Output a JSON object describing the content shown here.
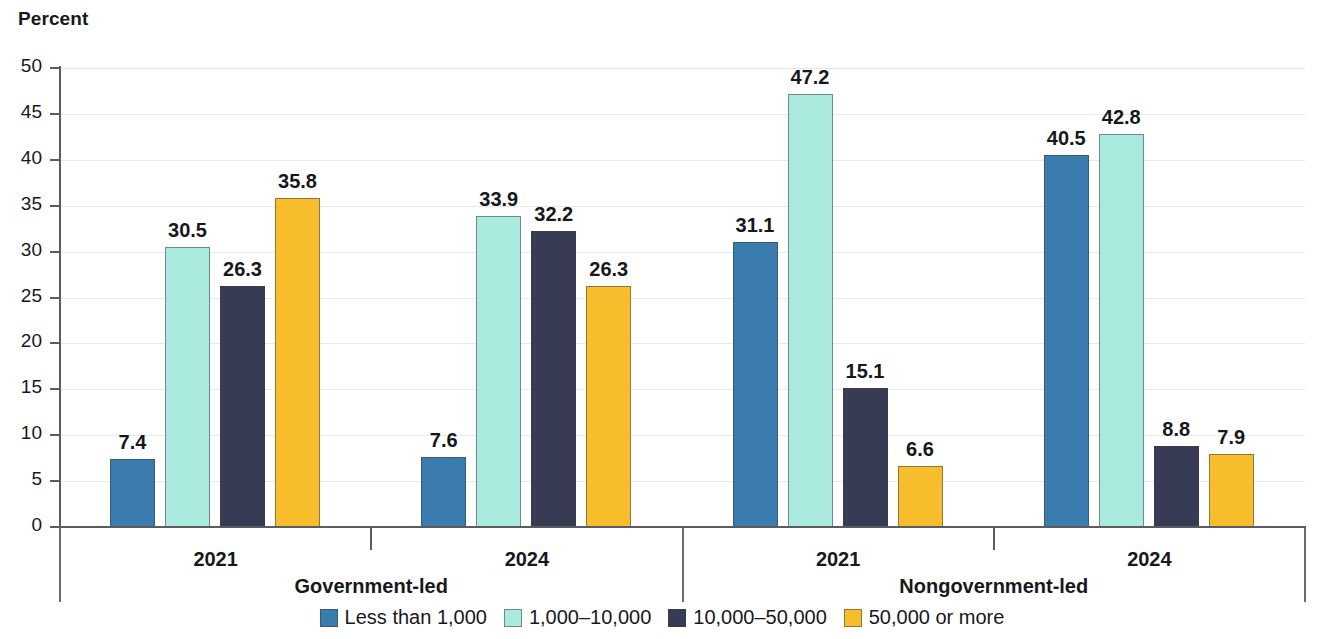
{
  "chart_data": {
    "type": "bar",
    "title": "",
    "ylabel": "Percent",
    "xlabel": "",
    "ylim": [
      0,
      50
    ],
    "ytick_step": 5,
    "yticks": [
      50,
      45,
      40,
      35,
      30,
      25,
      20,
      15,
      10,
      5,
      0
    ],
    "grid": true,
    "legend_position": "bottom",
    "categories": [
      "2021",
      "2024",
      "2021",
      "2024"
    ],
    "group_labels": [
      "Government-led",
      "Nongovernment-led"
    ],
    "groups": [
      {
        "super_label": "Government-led",
        "year": "2021",
        "values": [
          7.4,
          30.5,
          26.3,
          35.8
        ],
        "labels": [
          "7.4",
          "30.5",
          "26.3",
          "35.8"
        ]
      },
      {
        "super_label": "Government-led",
        "year": "2024",
        "values": [
          7.6,
          33.9,
          32.2,
          26.3
        ],
        "labels": [
          "7.6",
          "33.9",
          "32.2",
          "26.3"
        ]
      },
      {
        "super_label": "Nongovernment-led",
        "year": "2021",
        "values": [
          31.1,
          47.2,
          15.1,
          6.6
        ],
        "labels": [
          "31.1",
          "47.2",
          "15.1",
          "6.6"
        ]
      },
      {
        "super_label": "Nongovernment-led",
        "year": "2024",
        "values": [
          40.5,
          42.8,
          8.8,
          7.9
        ],
        "labels": [
          "40.5",
          "42.8",
          "8.8",
          "7.9"
        ]
      }
    ],
    "series": [
      {
        "name": "Less than 1,000",
        "color": "#3a7cae",
        "values": [
          7.4,
          7.6,
          31.1,
          40.5
        ]
      },
      {
        "name": "1,000–10,000",
        "color": "#aaeade",
        "values": [
          30.5,
          33.9,
          47.2,
          42.8
        ]
      },
      {
        "name": "10,000–50,000",
        "color": "#373b54",
        "values": [
          26.3,
          32.2,
          15.1,
          8.8
        ]
      },
      {
        "name": "50,000 or more",
        "color": "#f7bd2c",
        "values": [
          35.8,
          26.3,
          6.6,
          7.9
        ]
      }
    ],
    "legend": [
      {
        "label": "Less than 1,000",
        "color": "#3a7cae"
      },
      {
        "label": "1,000–10,000",
        "color": "#aaeade"
      },
      {
        "label": "10,000–50,000",
        "color": "#373b54"
      },
      {
        "label": "50,000 or more",
        "color": "#f7bd2c"
      }
    ]
  }
}
